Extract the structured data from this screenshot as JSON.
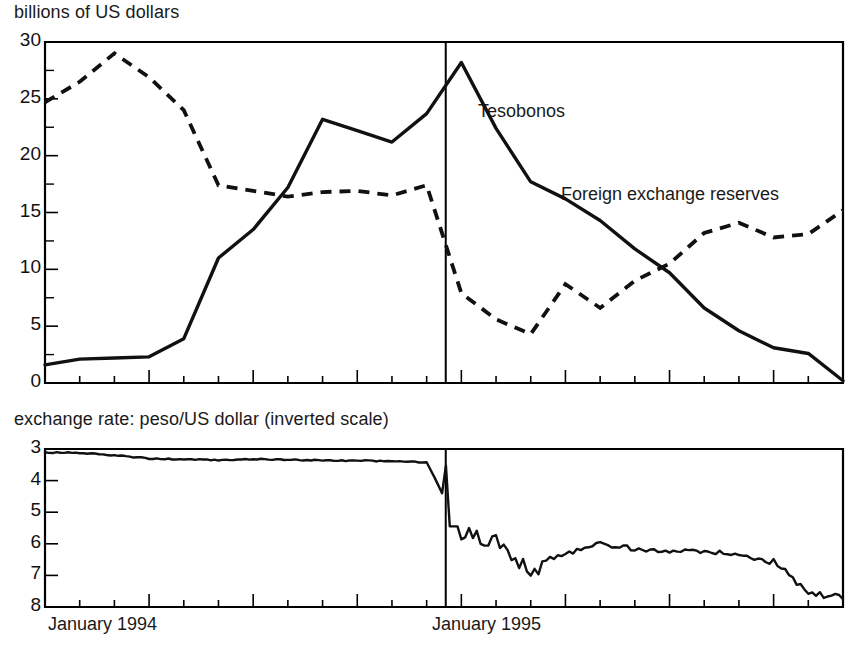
{
  "figure": {
    "top_panel_title": "billions of US dollars",
    "bottom_panel_title": "exchange rate: peso/US dollar (inverted scale)",
    "x_labels": [
      "January 1994",
      "January 1995"
    ],
    "series_labels": {
      "tesobonos": "Tesobonos",
      "reserves": "Foreign exchange reserves"
    },
    "line_color": "#111111",
    "frame_color": "#000000",
    "background": "#ffffff"
  },
  "top_axis": {
    "tick_labels": [
      "30",
      "25",
      "20",
      "15",
      "10",
      "5",
      "0"
    ],
    "tick_values": [
      30,
      25,
      20,
      15,
      10,
      5,
      0
    ],
    "ylim": [
      0,
      30
    ],
    "minor_step": 2.5
  },
  "bottom_axis": {
    "tick_labels": [
      "3",
      "4",
      "5",
      "6",
      "7",
      "8"
    ],
    "tick_values": [
      3,
      4,
      5,
      6,
      7,
      8
    ],
    "ylim": [
      3,
      8
    ],
    "inverted": true
  },
  "chart_data": [
    {
      "type": "line",
      "title": "billions of US dollars",
      "xlabel": "",
      "ylabel": "billions of US dollars",
      "ylim": [
        0,
        30
      ],
      "yticks": [
        0,
        5,
        10,
        15,
        20,
        25,
        30
      ],
      "grid": false,
      "legend": "inline-annotations",
      "x": [
        "1994-01",
        "1994-02",
        "1994-03",
        "1994-04",
        "1994-05",
        "1994-06",
        "1994-07",
        "1994-08",
        "1994-09",
        "1994-10",
        "1994-11",
        "1994-12",
        "1995-01",
        "1995-02",
        "1995-03",
        "1995-04",
        "1995-05",
        "1995-06",
        "1995-07",
        "1995-08",
        "1995-09",
        "1995-10",
        "1995-11",
        "1995-12"
      ],
      "annotations": [
        {
          "text": "Tesobonos",
          "x": "1995-02",
          "y": 23.5
        },
        {
          "text": "Foreign exchange reserves",
          "x": "1995-07",
          "y": 16.5
        }
      ],
      "vertical_marker": {
        "x": "1994-12",
        "label": "devaluation"
      },
      "series": [
        {
          "name": "Tesobonos",
          "style": "solid",
          "values": [
            1.6,
            2.1,
            2.2,
            2.3,
            3.9,
            11.0,
            13.5,
            17.2,
            23.2,
            22.2,
            21.2,
            23.7,
            28.2,
            22.4,
            17.7,
            16.2,
            14.3,
            11.8,
            9.7,
            6.6,
            4.6,
            3.1,
            2.6,
            0.2
          ]
        },
        {
          "name": "Foreign exchange reserves",
          "style": "dashed",
          "values": [
            24.7,
            26.5,
            29.0,
            26.9,
            24.0,
            17.4,
            16.9,
            16.4,
            16.8,
            16.9,
            16.5,
            17.4,
            7.9,
            5.6,
            4.3,
            8.7,
            6.6,
            9.0,
            10.5,
            13.2,
            14.1,
            12.8,
            13.1,
            15.2
          ]
        }
      ]
    },
    {
      "type": "line",
      "title": "exchange rate: peso/US dollar (inverted scale)",
      "xlabel": "",
      "ylabel": "peso/US dollar",
      "ylim": [
        3,
        8
      ],
      "yticks": [
        3,
        4,
        5,
        6,
        7,
        8
      ],
      "inverted_yaxis": true,
      "grid": false,
      "x": [
        "1994-01",
        "1994-02",
        "1994-03",
        "1994-04",
        "1994-05",
        "1994-06",
        "1994-07",
        "1994-08",
        "1994-09",
        "1994-10",
        "1994-11",
        "1994-12",
        "1995-01",
        "1995-02",
        "1995-03",
        "1995-04",
        "1995-05",
        "1995-06",
        "1995-07",
        "1995-08",
        "1995-09",
        "1995-10",
        "1995-11",
        "1995-12"
      ],
      "series": [
        {
          "name": "peso/US dollar",
          "style": "solid",
          "values": [
            3.11,
            3.12,
            3.2,
            3.3,
            3.33,
            3.35,
            3.32,
            3.34,
            3.36,
            3.37,
            3.39,
            3.42,
            5.6,
            5.9,
            6.8,
            6.3,
            6.0,
            6.15,
            6.2,
            6.25,
            6.35,
            6.6,
            7.6,
            7.75
          ]
        }
      ]
    }
  ]
}
